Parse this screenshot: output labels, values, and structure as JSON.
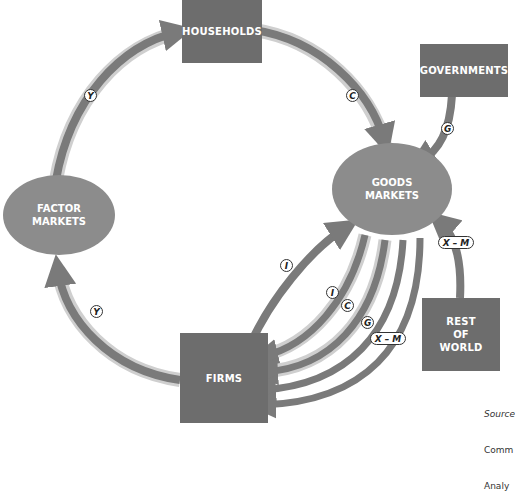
{
  "diagram": {
    "type": "circular-flow",
    "nodes": {
      "households": "HOUSEHOLDS",
      "governments": "GOVERNMENTS",
      "factor_markets_line1": "FACTOR",
      "factor_markets_line2": "MARKETS",
      "goods_markets_line1": "GOODS",
      "goods_markets_line2": "MARKETS",
      "rest_of_world_line1": "REST",
      "rest_of_world_line2": "OF",
      "rest_of_world_line3": "WORLD",
      "firms": "FIRMS"
    },
    "flow_labels": {
      "y_top": "Y",
      "c_top": "C",
      "g_gov": "G",
      "xm_row": "X – M",
      "y_bottom": "Y",
      "i_outer": "I",
      "i_inner": "I",
      "c_inner": "C",
      "g_inner": "G",
      "xm_inner": "X – M"
    },
    "flows": [
      {
        "from": "FACTOR MARKETS",
        "to": "HOUSEHOLDS",
        "label": "Y"
      },
      {
        "from": "HOUSEHOLDS",
        "to": "GOODS MARKETS",
        "label": "C"
      },
      {
        "from": "GOVERNMENTS",
        "to": "GOODS MARKETS",
        "label": "G"
      },
      {
        "from": "REST OF WORLD",
        "to": "GOODS MARKETS",
        "label": "X – M"
      },
      {
        "from": "FIRMS",
        "to": "FACTOR MARKETS",
        "label": "Y"
      },
      {
        "from": "FIRMS",
        "to": "GOODS MARKETS",
        "label": "I"
      },
      {
        "from": "GOODS MARKETS",
        "to": "FIRMS",
        "label": "I"
      },
      {
        "from": "GOODS MARKETS",
        "to": "FIRMS",
        "label": "C"
      },
      {
        "from": "GOODS MARKETS",
        "to": "FIRMS",
        "label": "G"
      },
      {
        "from": "GOODS MARKETS",
        "to": "FIRMS",
        "label": "X – M"
      }
    ],
    "source_lines": [
      "Source",
      "Comm",
      "Analy"
    ]
  },
  "colors": {
    "box": "#6d6d6d",
    "ellipse": "#8c8c8c",
    "flow": "#7a7a7a",
    "flow_halo": "#cfcfcf"
  }
}
